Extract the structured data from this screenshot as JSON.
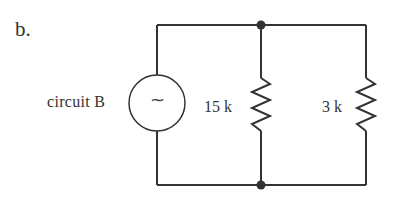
{
  "diagram": {
    "part_label": "b.",
    "source": {
      "label": "circuit B",
      "symbol": "~",
      "type": "ac-source"
    },
    "resistors": [
      {
        "label": "15 k",
        "branch": "middle"
      },
      {
        "label": "3 k",
        "branch": "right"
      }
    ],
    "nodes": [
      "top-junction",
      "bottom-junction"
    ],
    "colors": {
      "wire": "#333333",
      "background": "#ffffff"
    }
  }
}
